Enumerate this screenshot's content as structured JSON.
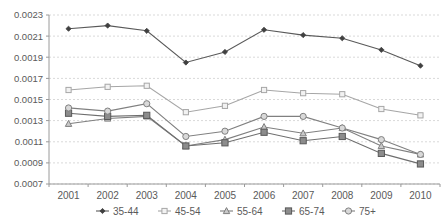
{
  "chart_data": {
    "type": "line",
    "title": "",
    "subtitle": "",
    "xlabel": "",
    "ylabel": "",
    "grid": true,
    "legend_position": "bottom",
    "categories": [
      "2001",
      "2002",
      "2003",
      "2004",
      "2005",
      "2006",
      "2007",
      "2008",
      "2009",
      "2010"
    ],
    "x": [
      2001,
      2002,
      2003,
      2004,
      2005,
      2006,
      2007,
      2008,
      2009,
      2010
    ],
    "ylim": [
      0.0007,
      0.0023
    ],
    "ytick_labels": [
      "0.0023",
      "0.0021",
      "0.0019",
      "0.0017",
      "0.0015",
      "0.0013",
      "0.0011",
      "0.0009",
      "0.0007"
    ],
    "yticks": [
      0.0023,
      0.0021,
      0.0019,
      0.0017,
      0.0015,
      0.0013,
      0.0011,
      0.0009,
      0.0007
    ],
    "series": [
      {
        "name": "35-44",
        "marker": "filled-diamond",
        "color": "#595959",
        "values": [
          0.00217,
          0.0022,
          0.00215,
          0.00185,
          0.00195,
          0.00216,
          0.00211,
          0.00208,
          0.00197,
          0.00182
        ]
      },
      {
        "name": "45-54",
        "marker": "open-square",
        "color": "#a6a6a6",
        "values": [
          0.00159,
          0.00162,
          0.00163,
          0.00138,
          0.00144,
          0.00159,
          0.00156,
          0.00155,
          0.00141,
          0.00135
        ]
      },
      {
        "name": "55-64",
        "marker": "open-triangle",
        "color": "#7f7f7f",
        "values": [
          0.00127,
          0.00132,
          0.00134,
          0.00106,
          0.00112,
          0.00124,
          0.00118,
          0.00123,
          0.00106,
          0.00098
        ]
      },
      {
        "name": "65-74",
        "marker": "filled-square",
        "color": "#6e6e6e",
        "values": [
          0.00137,
          0.00134,
          0.00135,
          0.00106,
          0.00109,
          0.00119,
          0.00111,
          0.00115,
          0.00099,
          0.00089
        ]
      },
      {
        "name": "75+",
        "marker": "open-circle",
        "color": "#808080",
        "values": [
          0.00142,
          0.00139,
          0.00146,
          0.00115,
          0.0012,
          0.00134,
          0.00134,
          0.00123,
          0.00112,
          0.00098
        ]
      }
    ]
  },
  "legend": {
    "items": [
      {
        "label": "35-44"
      },
      {
        "label": "45-54"
      },
      {
        "label": "55-64"
      },
      {
        "label": "65-74"
      },
      {
        "label": "75+"
      }
    ]
  }
}
